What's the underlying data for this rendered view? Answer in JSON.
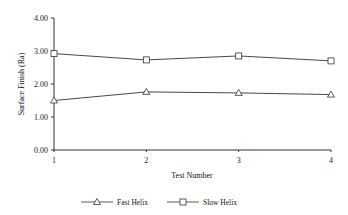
{
  "chart_data": {
    "type": "line",
    "title": "",
    "xlabel": "Test Number",
    "ylabel": "Surface Finish (Ra)",
    "categories": [
      1,
      2,
      3,
      4
    ],
    "x_tick_labels": [
      "1",
      "2",
      "3",
      "4"
    ],
    "y_tick_labels": [
      "0.00",
      "1.00",
      "2.00",
      "3.00",
      "4.00"
    ],
    "ylim": [
      0,
      4
    ],
    "grid": false,
    "legend_position": "bottom",
    "series": [
      {
        "name": "Fast Helix",
        "marker": "triangle",
        "values": [
          1.5,
          1.76,
          1.73,
          1.68
        ]
      },
      {
        "name": "Slow Helix",
        "marker": "square",
        "values": [
          2.92,
          2.73,
          2.85,
          2.7
        ]
      }
    ]
  },
  "legend": {
    "items": [
      {
        "label": "Fast Helix"
      },
      {
        "label": "Slow Helix"
      }
    ]
  }
}
